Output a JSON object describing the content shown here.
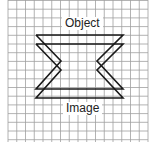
{
  "labels": {
    "object": "Object",
    "image": "Image"
  },
  "colors": {
    "grid": "#9a9a9a",
    "line": "#1a1a1a"
  }
}
